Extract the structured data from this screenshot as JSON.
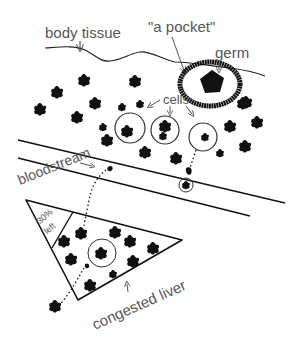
{
  "labels": {
    "body_tissue": "body tissue",
    "pocket": "\"a pocket\"",
    "germ": "germ",
    "cells": "cells",
    "bloodstream": "bloodstream",
    "percent_left": "30%",
    "left_word": "left",
    "congested_liver": "congested liver"
  },
  "colors": {
    "ink": "#111111",
    "label": "#555555",
    "background": "#ffffff"
  }
}
